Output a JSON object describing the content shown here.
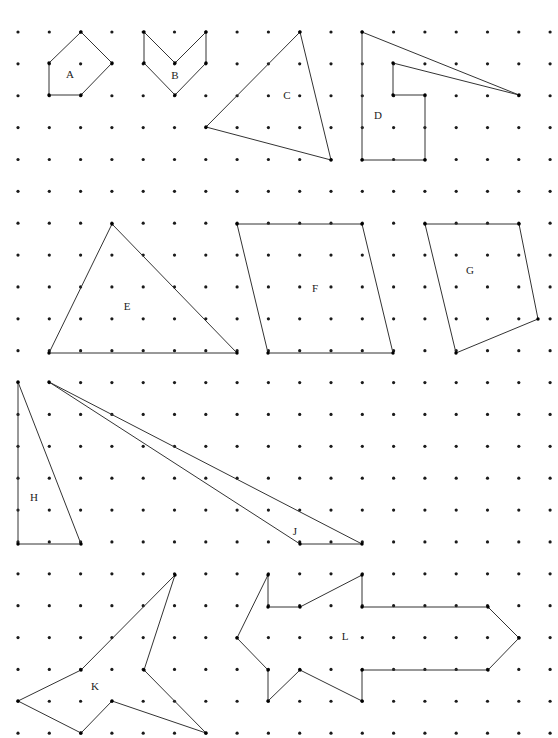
{
  "canvas": {
    "width": 558,
    "height": 738,
    "background": "#ffffff"
  },
  "grid": {
    "name": "dot-grid",
    "origin_x": 18,
    "origin_y": 32,
    "spacing_x": 31.3,
    "spacing_y": 31.87,
    "cols": 18,
    "rows": 23,
    "dot_radius": 1.6,
    "dot_color": "#1a1a1a"
  },
  "style": {
    "stroke_color": "#333333",
    "stroke_width": 1,
    "vertex_color": "#000000",
    "vertex_radius": 1.7,
    "label_color": "#222222",
    "label_font_size": 11
  },
  "shapes": [
    {
      "id": "A",
      "label": "A",
      "label_x": 70,
      "label_y": 75,
      "kind": "pentagon",
      "closed": true,
      "vertices": [
        [
          49,
          63
        ],
        [
          81,
          32
        ],
        [
          112,
          63
        ],
        [
          81,
          95
        ],
        [
          49,
          95
        ]
      ]
    },
    {
      "id": "B",
      "label": "B",
      "label_x": 175,
      "label_y": 76,
      "kind": "chevron",
      "closed": true,
      "vertices": [
        [
          144,
          32
        ],
        [
          144,
          63
        ],
        [
          175,
          95
        ],
        [
          206,
          63
        ],
        [
          206,
          32
        ],
        [
          175,
          63
        ]
      ]
    },
    {
      "id": "C",
      "label": "C",
      "label_x": 287,
      "label_y": 96,
      "kind": "triangle",
      "closed": true,
      "vertices": [
        [
          300,
          32
        ],
        [
          331,
          160
        ],
        [
          206,
          127
        ]
      ]
    },
    {
      "id": "D",
      "label": "D",
      "label_x": 378,
      "label_y": 116,
      "kind": "concave-polygon",
      "closed": true,
      "vertices": [
        [
          362,
          32
        ],
        [
          519,
          95
        ],
        [
          393,
          63
        ],
        [
          393,
          95
        ],
        [
          425,
          95
        ],
        [
          425,
          160
        ],
        [
          362,
          160
        ]
      ]
    },
    {
      "id": "E",
      "label": "E",
      "label_x": 127,
      "label_y": 307,
      "kind": "triangle",
      "closed": true,
      "vertices": [
        [
          112,
          224
        ],
        [
          237,
          353
        ],
        [
          49,
          353
        ]
      ]
    },
    {
      "id": "F",
      "label": "F",
      "label_x": 315,
      "label_y": 289,
      "kind": "parallelogram",
      "closed": true,
      "vertices": [
        [
          237,
          224
        ],
        [
          362,
          224
        ],
        [
          393,
          353
        ],
        [
          268,
          353
        ]
      ]
    },
    {
      "id": "G",
      "label": "G",
      "label_x": 470,
      "label_y": 271,
      "kind": "quadrilateral",
      "closed": true,
      "vertices": [
        [
          425,
          224
        ],
        [
          519,
          224
        ],
        [
          538,
          319
        ],
        [
          456,
          353
        ]
      ]
    },
    {
      "id": "H",
      "label": "H",
      "label_x": 34,
      "label_y": 498,
      "kind": "triangle",
      "closed": true,
      "vertices": [
        [
          18,
          382
        ],
        [
          81,
          544
        ],
        [
          18,
          544
        ]
      ]
    },
    {
      "id": "J",
      "label": "J",
      "label_x": 295,
      "label_y": 532,
      "kind": "thin-triangle",
      "closed": true,
      "vertices": [
        [
          49,
          382
        ],
        [
          362,
          544
        ],
        [
          300,
          544
        ]
      ]
    },
    {
      "id": "K",
      "label": "K",
      "label_x": 95,
      "label_y": 687,
      "kind": "star-polygon",
      "closed": true,
      "vertices": [
        [
          175,
          575
        ],
        [
          144,
          670
        ],
        [
          206,
          733
        ],
        [
          112,
          701
        ],
        [
          81,
          733
        ],
        [
          18,
          701
        ],
        [
          81,
          670
        ]
      ]
    },
    {
      "id": "L",
      "label": "L",
      "label_x": 345,
      "label_y": 637,
      "kind": "arrow-polygon",
      "closed": true,
      "vertices": [
        [
          268,
          575
        ],
        [
          268,
          607
        ],
        [
          300,
          607
        ],
        [
          362,
          575
        ],
        [
          362,
          607
        ],
        [
          488,
          607
        ],
        [
          519,
          638
        ],
        [
          488,
          670
        ],
        [
          362,
          670
        ],
        [
          362,
          701
        ],
        [
          300,
          670
        ],
        [
          268,
          701
        ],
        [
          268,
          670
        ],
        [
          237,
          638
        ]
      ]
    }
  ]
}
